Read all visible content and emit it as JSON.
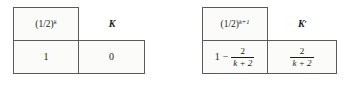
{
  "figure": {
    "background_color": "#ffffff",
    "border_color": "#5a5a5a",
    "cell_fill": "#fbfbf9",
    "text_color": "#1a1a1a"
  },
  "tables": [
    {
      "id": "left",
      "headers": {
        "col_a": {
          "base": "(1/2)",
          "exponent": "k",
          "full": "(1/2)^k"
        },
        "col_b": {
          "symbol": "K",
          "prime": "",
          "full": "K"
        }
      },
      "body": {
        "col_a": {
          "type": "plain",
          "value": "1"
        },
        "col_b": {
          "type": "plain",
          "value": "0"
        }
      }
    },
    {
      "id": "right",
      "headers": {
        "col_a": {
          "base": "(1/2)",
          "exponent": "k+1",
          "full": "(1/2)^(k+1)"
        },
        "col_b": {
          "symbol": "K",
          "prime": "′",
          "full": "K′"
        }
      },
      "body": {
        "col_a": {
          "type": "fraction_expression",
          "lead": "1",
          "operator": "−",
          "numerator": "2",
          "denominator": "k + 2",
          "full": "1 − 2/(k + 2)"
        },
        "col_b": {
          "type": "fraction",
          "numerator": "2",
          "denominator": "k + 2",
          "full": "2/(k + 2)"
        }
      }
    }
  ]
}
